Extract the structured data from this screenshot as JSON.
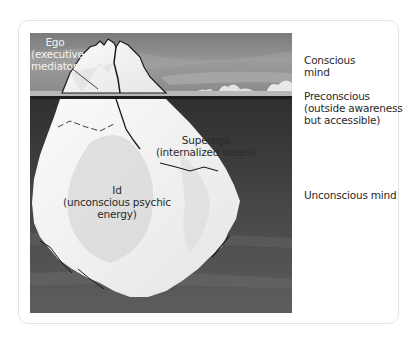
{
  "diagram": {
    "colors": {
      "sky": "#8c8c8c",
      "water": "#3c3c3c",
      "ice": "#f4f4f4",
      "ice_shadow": "#d2d2d2",
      "outline": "#1a1a1a",
      "text": "#2a2a2a",
      "text_on_dark": "#f2f2f2",
      "card_border": "#e3e3e3"
    },
    "iceberg_labels": {
      "ego": {
        "line1": "Ego",
        "line2": "(executive",
        "line3": "mediator)"
      },
      "superego": {
        "line1": "Superego",
        "line2": "(internalized ideals)"
      },
      "id": {
        "line1": "Id",
        "line2": "(unconscious psychic",
        "line3": "energy)"
      }
    },
    "levels": [
      {
        "line1": "Conscious",
        "line2": "mind"
      },
      {
        "line1": "Preconscious",
        "line2": "(outside awareness",
        "line3": "but accessible)"
      },
      {
        "line1": "Unconscious mind"
      }
    ]
  }
}
